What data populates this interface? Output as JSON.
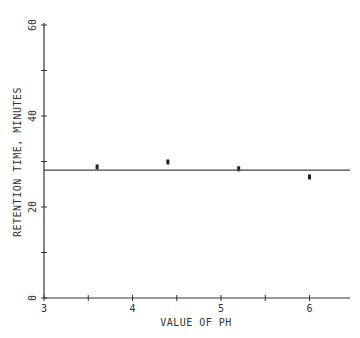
{
  "chart_data": {
    "type": "scatter",
    "title": "",
    "xlabel": "VALUE OF PH",
    "ylabel": "RETENTION TIME, MINUTES",
    "xlim": [
      3,
      6.5
    ],
    "ylim": [
      0,
      60
    ],
    "x_ticks": [
      3,
      3.5,
      4,
      4.5,
      5,
      5.5,
      6
    ],
    "x_tick_labels": [
      "3",
      "",
      "4",
      "",
      "5",
      "",
      "6"
    ],
    "y_ticks": [
      0,
      10,
      20,
      30,
      40,
      50,
      60
    ],
    "y_tick_labels": [
      "0",
      "",
      "20",
      "",
      "40",
      "",
      "60"
    ],
    "grid": false,
    "legend": null,
    "series": [
      {
        "name": "observed",
        "marker": "square",
        "x": [
          3.6,
          4.4,
          5.2,
          6.0
        ],
        "y": [
          28.8,
          29.9,
          28.4,
          26.6
        ]
      },
      {
        "name": "mean-line",
        "type": "line",
        "x": [
          3,
          6.5
        ],
        "y": [
          28.1,
          28.1
        ]
      }
    ]
  }
}
